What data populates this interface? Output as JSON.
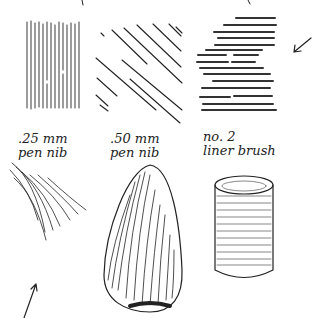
{
  "illustration": {
    "subject": "pen and brush hatching technique examples",
    "ink_color": "#222222",
    "background_color": "#ffffff"
  },
  "samples": [
    {
      "tool_line1": ".25 mm",
      "tool_line2": "pen nib",
      "top_example": "vertical-hatching",
      "bottom_example": "curved-hatching-strokes"
    },
    {
      "tool_line1": ".50 mm",
      "tool_line2": "pen nib",
      "top_example": "diagonal-hatching",
      "bottom_example": "shaded-egg"
    },
    {
      "tool_line1": "no. 2",
      "tool_line2": "liner brush",
      "top_example": "horizontal-brush-strokes",
      "bottom_example": "shaded-cylinder"
    }
  ],
  "arrows": [
    {
      "position": "right-of-brush-strokes",
      "direction": "down-left"
    },
    {
      "position": "below-curved-strokes",
      "direction": "up-right"
    }
  ]
}
